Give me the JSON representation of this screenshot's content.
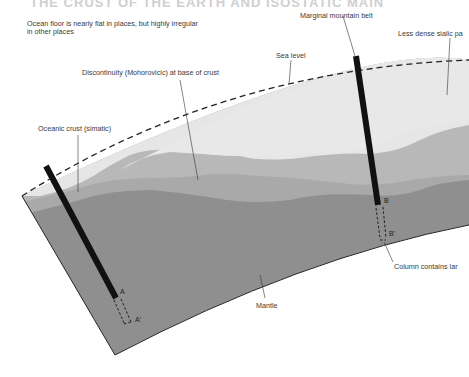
{
  "title_partial": "THE CRUST OF THE EARTH AND ISOSTATIC MAIN",
  "labels": {
    "ocean_floor": "Ocean floor is nearly flat in places, but highly irregular",
    "ocean_floor_line2": "in other places",
    "marginal_mountain_belt": "Marginal mountain belt",
    "less_dense_sialic": "Less dense sialic pa",
    "sea_level": "Sea level",
    "discontinuity": "Discontinuity (Mohorovicic) at base of crust",
    "oceanic_crust": "Oceanic crust (simatic)",
    "mantle": "Mantle",
    "column_contains": "Column contains lar"
  },
  "points": {
    "A": "A",
    "A_prime": "A'",
    "B": "B",
    "B_prime": "B'"
  },
  "colors": {
    "sialic_light": "#e6e6e6",
    "simatic_mid": "#b9b9b9",
    "mantle": "#8f8f8f",
    "column": "#111111",
    "outline": "#222222"
  }
}
